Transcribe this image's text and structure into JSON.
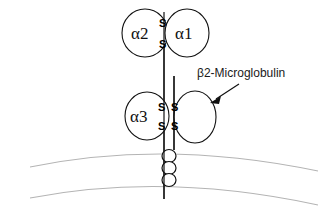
{
  "figure": {
    "background_color": "#ffffff",
    "line_color": "#111111",
    "membrane_color": "#b4b4b4"
  },
  "domains": {
    "alpha2": {
      "label": "α2",
      "cx": 145,
      "cy": 33,
      "rx": 23,
      "ry": 24
    },
    "alpha1": {
      "label": "α1",
      "cx": 187,
      "cy": 33,
      "rx": 22,
      "ry": 24
    },
    "alpha3": {
      "label": "α3",
      "cx": 147,
      "cy": 116,
      "rx": 22,
      "ry": 24
    },
    "beta2m": {
      "label": "",
      "cx": 195,
      "cy": 117,
      "rx": 21,
      "ry": 26
    }
  },
  "disulfides": {
    "top_pair": [
      {
        "text": "S",
        "x": 160,
        "y": 23
      },
      {
        "text": "S",
        "x": 160,
        "y": 45
      }
    ],
    "lower_quad": [
      {
        "text": "S",
        "x": 160,
        "y": 107
      },
      {
        "text": "S",
        "x": 173,
        "y": 107
      },
      {
        "text": "S",
        "x": 160,
        "y": 126
      },
      {
        "text": "S",
        "x": 173,
        "y": 126
      }
    ]
  },
  "annotation": {
    "label": "β2-Microglobulin",
    "label_x": 197,
    "label_y": 77,
    "arrow_start": {
      "x": 239,
      "y": 84
    },
    "arrow_end": {
      "x": 211,
      "y": 102
    }
  },
  "chains": {
    "alpha_chain": {
      "x": 164,
      "y_top": 33,
      "y_bottom": 199
    },
    "beta2m_chain": {
      "x": 174,
      "y_top": 76,
      "y_bottom": 150
    }
  },
  "transmembrane_helix": {
    "coil_count": 3,
    "cx": 169,
    "rx": 7,
    "ry": 6.5,
    "cy_values": [
      156,
      168,
      180
    ]
  },
  "membrane": {
    "outer_arc": "M 30 167 Q 165 139 318 171",
    "inner_arc": "M 30 198 Q 165 172 318 205"
  }
}
